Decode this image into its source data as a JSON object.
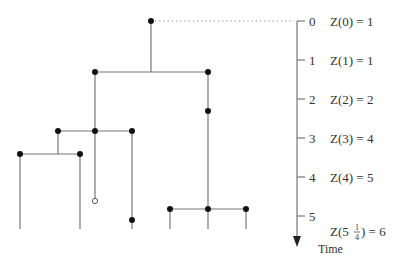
{
  "diagram": {
    "type": "branching-process-tree",
    "axis": {
      "title": "Time",
      "ticks": [
        "0",
        "1",
        "2",
        "3",
        "4",
        "5"
      ],
      "counts": [
        "Z(0) = 1",
        "Z(1) = 1",
        "Z(2) = 2",
        "Z(3) = 4",
        "Z(4) = 5"
      ],
      "last_count": {
        "prefix": "Z(5",
        "frac_num": "1",
        "frac_den": "4",
        "suffix": ") = 6"
      }
    },
    "colors": {
      "edge": "#777777",
      "node": "#111111",
      "text": "#333333"
    }
  }
}
